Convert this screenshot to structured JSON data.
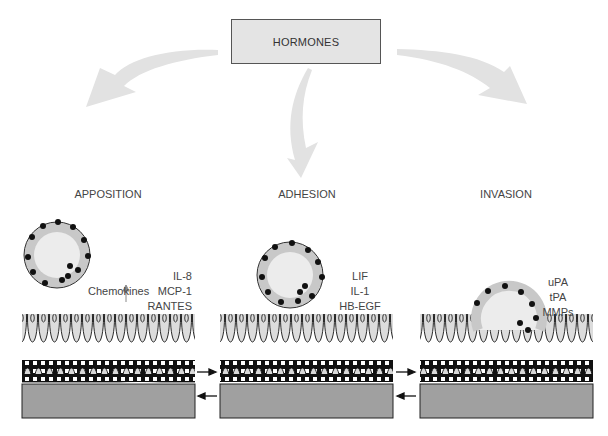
{
  "title": "HORMONES",
  "stages": [
    {
      "label": "APPOSITION",
      "factors_label": "Chemokines",
      "factors": [
        "IL-8",
        "MCP-1",
        "RANTES"
      ]
    },
    {
      "label": "ADHESION",
      "factors": [
        "LIF",
        "IL-1",
        "HB-EGF"
      ]
    },
    {
      "label": "INVASION",
      "factors": [
        "uPA",
        "tPA",
        "MMPs"
      ]
    }
  ],
  "colors": {
    "box_fill": "#e4e4e4",
    "arrow_fill": "#e2e2e2",
    "stroma": "#a0a0a0",
    "cell_fill": "#d8d8d8",
    "nucleus": "#1a1a1a",
    "outline": "#111111"
  }
}
